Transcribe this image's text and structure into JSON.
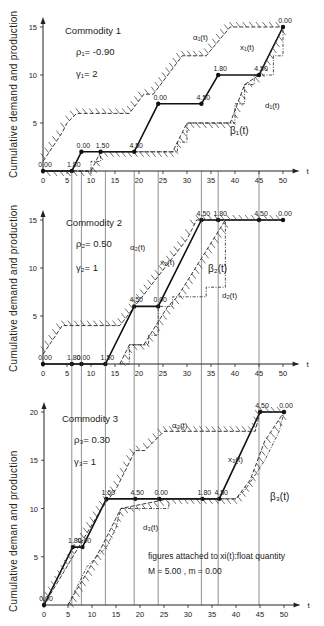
{
  "figure": {
    "ylabel_1": "Cumulative demand and production",
    "ylabel_2": "Cumulative demand and production",
    "ylabel_3": "Cumulative deman and production",
    "xlabel": "t",
    "note_line1": "figures attached to xi(t):float quantity",
    "note_line2": "M = 5.00 ,   m = 0.00"
  },
  "panels": [
    {
      "title": "Commodity 1",
      "rho": "ρ₁= -0.90",
      "gamma": "γ₁= 2",
      "labels": {
        "alpha": "α₁(t)",
        "x": "x₁(t)",
        "d": "d₁(t)",
        "beta": "β₁(t)"
      }
    },
    {
      "title": "Commodity 2",
      "rho": "ρ₂= 0.50",
      "gamma": "γ₂= 1",
      "labels": {
        "alpha": "α₂(t)",
        "x": "x₂(t)",
        "d": "d₂(t)",
        "beta": "β₂(t)"
      }
    },
    {
      "title": "Commodity 3",
      "rho": "ρ₃= 0.30",
      "gamma": "γ₃= 1",
      "labels": {
        "alpha": "α₃(t)",
        "x": "x₃(t)",
        "d": "d₃(t)",
        "beta": "β₃(t)"
      }
    }
  ],
  "chart_data": [
    {
      "type": "line",
      "title": "Commodity 1",
      "xlabel": "t",
      "ylabel": "Cumulative demand and production",
      "xlim": [
        0,
        50
      ],
      "ylim": [
        0,
        15
      ],
      "xticks": [
        0,
        5,
        10,
        15,
        20,
        25,
        30,
        35,
        40,
        45,
        50
      ],
      "yticks": [
        5,
        10,
        15
      ],
      "params": {
        "rho": -0.9,
        "gamma": 2
      },
      "series": [
        {
          "name": "x1(t)",
          "points": [
            [
              0,
              0
            ],
            [
              6,
              0
            ],
            [
              8,
              2
            ],
            [
              12,
              2
            ],
            [
              19,
              2
            ],
            [
              24,
              7
            ],
            [
              33,
              7
            ],
            [
              36.5,
              10
            ],
            [
              45,
              10
            ],
            [
              50,
              15
            ]
          ]
        },
        {
          "name": "alpha1(t)",
          "points": [
            [
              0,
              1
            ],
            [
              4,
              4
            ],
            [
              5,
              5
            ],
            [
              7,
              6
            ],
            [
              18,
              6
            ],
            [
              21,
              8
            ],
            [
              23,
              8
            ],
            [
              29,
              12
            ],
            [
              34,
              12
            ],
            [
              39,
              15
            ],
            [
              50,
              15
            ]
          ]
        },
        {
          "name": "beta1(t)",
          "points": [
            [
              0,
              0
            ],
            [
              7,
              0
            ],
            [
              10,
              0
            ],
            [
              12,
              2
            ],
            [
              27,
              2
            ],
            [
              30,
              5
            ],
            [
              39,
              5
            ],
            [
              42,
              9
            ],
            [
              45,
              10
            ],
            [
              50,
              15
            ]
          ]
        },
        {
          "name": "d1(t)",
          "points": [
            [
              0,
              0
            ],
            [
              10,
              0
            ],
            [
              10,
              1
            ],
            [
              12,
              1
            ],
            [
              12,
              2
            ],
            [
              28,
              2
            ],
            [
              28,
              3
            ],
            [
              30,
              3
            ],
            [
              30,
              5
            ],
            [
              40,
              5
            ],
            [
              40,
              7
            ],
            [
              42,
              7
            ],
            [
              42,
              9
            ],
            [
              44,
              9
            ],
            [
              44,
              10
            ],
            [
              48,
              10
            ],
            [
              48,
              12
            ],
            [
              50,
              12
            ],
            [
              50,
              15
            ]
          ]
        }
      ],
      "point_labels": [
        {
          "t": 0,
          "y": 0,
          "label": "0.00"
        },
        {
          "t": 6,
          "y": 0,
          "label": "1.80"
        },
        {
          "t": 8,
          "y": 2,
          "label": "0.00"
        },
        {
          "t": 12,
          "y": 2,
          "label": "1.50"
        },
        {
          "t": 19,
          "y": 2,
          "label": "4.50"
        },
        {
          "t": 24,
          "y": 7,
          "label": "0.00"
        },
        {
          "t": 33,
          "y": 7,
          "label": "4.50"
        },
        {
          "t": 36.5,
          "y": 10,
          "label": "1.80"
        },
        {
          "t": 45,
          "y": 10,
          "label": "4.50"
        },
        {
          "t": 50,
          "y": 15,
          "label": "0.00"
        }
      ]
    },
    {
      "type": "line",
      "title": "Commodity 2",
      "xlabel": "t",
      "ylabel": "Cumulative demand and production",
      "xlim": [
        0,
        50
      ],
      "ylim": [
        0,
        15
      ],
      "xticks": [
        0,
        5,
        10,
        15,
        20,
        25,
        30,
        35,
        40,
        45,
        50
      ],
      "yticks": [
        5,
        10,
        15
      ],
      "params": {
        "rho": 0.5,
        "gamma": 1
      },
      "series": [
        {
          "name": "x2(t)",
          "points": [
            [
              0,
              0
            ],
            [
              6,
              0
            ],
            [
              8,
              0
            ],
            [
              13,
              0
            ],
            [
              19,
              6
            ],
            [
              24,
              6
            ],
            [
              33,
              15
            ],
            [
              36.5,
              15
            ],
            [
              45,
              15
            ],
            [
              50,
              15
            ]
          ]
        },
        {
          "name": "alpha2(t)",
          "points": [
            [
              0,
              1
            ],
            [
              4,
              4
            ],
            [
              16,
              4
            ],
            [
              30,
              13
            ],
            [
              31,
              14
            ],
            [
              32,
              15
            ],
            [
              50,
              15
            ]
          ]
        },
        {
          "name": "beta2(t)",
          "points": [
            [
              16,
              0
            ],
            [
              18,
              2
            ],
            [
              21,
              2
            ],
            [
              26,
              6
            ],
            [
              28,
              7
            ],
            [
              38,
              15
            ]
          ]
        },
        {
          "name": "d2(t)",
          "points": [
            [
              16,
              0
            ],
            [
              18,
              0
            ],
            [
              18,
              2
            ],
            [
              22,
              2
            ],
            [
              22,
              3
            ],
            [
              24,
              3
            ],
            [
              24,
              6
            ],
            [
              27,
              6
            ],
            [
              27,
              7
            ],
            [
              34,
              7
            ],
            [
              34,
              8
            ],
            [
              38,
              8
            ],
            [
              38,
              15
            ]
          ]
        }
      ],
      "point_labels": [
        {
          "t": 0,
          "y": 0,
          "label": "0.00"
        },
        {
          "t": 6,
          "y": 0,
          "label": "1.80"
        },
        {
          "t": 8,
          "y": 0,
          "label": "0.00"
        },
        {
          "t": 13,
          "y": 0,
          "label": "1.50"
        },
        {
          "t": 19,
          "y": 6,
          "label": "4.50"
        },
        {
          "t": 24,
          "y": 6,
          "label": "0.00"
        },
        {
          "t": 33,
          "y": 15,
          "label": "4.50"
        },
        {
          "t": 36.5,
          "y": 15,
          "label": "1.80"
        },
        {
          "t": 45,
          "y": 15,
          "label": "4.50"
        },
        {
          "t": 50,
          "y": 15,
          "label": "0.00"
        }
      ]
    },
    {
      "type": "line",
      "title": "Commodity 3",
      "xlabel": "t",
      "ylabel": "Cumulative deman and production",
      "xlim": [
        0,
        50
      ],
      "ylim": [
        0,
        20
      ],
      "xticks": [
        0,
        5,
        10,
        15,
        20,
        25,
        30,
        35,
        40,
        45,
        50
      ],
      "yticks": [
        5,
        10,
        15,
        20
      ],
      "params": {
        "rho": 0.3,
        "gamma": 1
      },
      "series": [
        {
          "name": "x3(t)",
          "points": [
            [
              0,
              0
            ],
            [
              6,
              6
            ],
            [
              8,
              6
            ],
            [
              13,
              11
            ],
            [
              19,
              11
            ],
            [
              24,
              11
            ],
            [
              33,
              11
            ],
            [
              36.5,
              11
            ],
            [
              45,
              20
            ],
            [
              50,
              20
            ]
          ]
        },
        {
          "name": "alpha3(t)",
          "points": [
            [
              0,
              0
            ],
            [
              12,
              10
            ],
            [
              15,
              12
            ],
            [
              17,
              14
            ],
            [
              19,
              16
            ],
            [
              21,
              16
            ],
            [
              25,
              18
            ],
            [
              44,
              18
            ],
            [
              45,
              20
            ],
            [
              50,
              20
            ]
          ]
        },
        {
          "name": "beta3(t)",
          "points": [
            [
              5,
              0
            ],
            [
              12,
              6
            ],
            [
              16,
              10
            ],
            [
              26,
              11
            ],
            [
              40,
              11
            ],
            [
              43,
              13
            ],
            [
              46,
              17
            ],
            [
              50,
              20
            ]
          ]
        },
        {
          "name": "d3(t)",
          "points": [
            [
              5,
              0
            ],
            [
              7,
              2
            ],
            [
              9,
              4
            ],
            [
              11,
              5
            ],
            [
              13,
              6
            ],
            [
              15,
              8
            ],
            [
              16,
              10
            ],
            [
              26,
              10
            ],
            [
              26,
              11
            ],
            [
              40,
              11
            ],
            [
              42,
              12
            ],
            [
              46,
              15
            ],
            [
              49,
              18
            ],
            [
              50,
              20
            ]
          ]
        }
      ],
      "point_labels": [
        {
          "t": 0,
          "y": 0,
          "label": "0.00"
        },
        {
          "t": 6,
          "y": 6,
          "label": "1.80"
        },
        {
          "t": 8,
          "y": 6,
          "label": "0.00"
        },
        {
          "t": 13,
          "y": 11,
          "label": "1.50"
        },
        {
          "t": 19,
          "y": 11,
          "label": "4.50"
        },
        {
          "t": 24,
          "y": 11,
          "label": "0.00"
        },
        {
          "t": 33,
          "y": 11,
          "label": "1.80"
        },
        {
          "t": 36.5,
          "y": 11,
          "label": "4.50"
        },
        {
          "t": 45,
          "y": 20,
          "label": "4.50"
        },
        {
          "t": 50,
          "y": 20,
          "label": "0.00"
        }
      ]
    }
  ]
}
